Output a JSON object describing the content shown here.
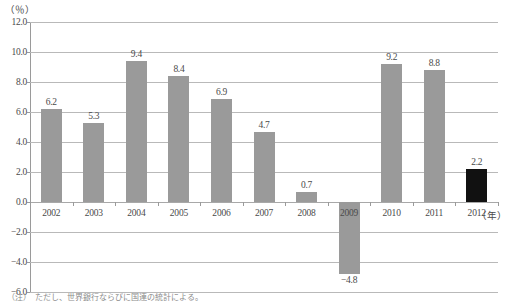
{
  "chart_data": {
    "type": "bar",
    "title": "",
    "subtitle": "",
    "xlabel": "(年)",
    "ylabel": "(%)",
    "categories": [
      "2002",
      "2003",
      "2004",
      "2005",
      "2006",
      "2007",
      "2008",
      "2009",
      "2010",
      "2011",
      "2012"
    ],
    "values": [
      6.2,
      5.3,
      9.4,
      8.4,
      6.9,
      4.7,
      0.7,
      -4.8,
      9.2,
      8.8,
      2.2
    ],
    "value_labels": [
      "6.2",
      "5.3",
      "9.4",
      "8.4",
      "6.9",
      "4.7",
      "0.7",
      "−4.8",
      "9.2",
      "8.8",
      "2.2"
    ],
    "highlight_index": 10,
    "ylim": [
      -6.0,
      12.0
    ],
    "yticks": [
      12.0,
      10.0,
      8.0,
      6.0,
      4.0,
      2.0,
      0.0,
      -2.0,
      -4.0,
      -6.0
    ],
    "ytick_labels": [
      "12.0",
      "10.0",
      "8.0",
      "6.0",
      "4.0",
      "2.0",
      "0.0",
      "−2.0",
      "−4.0",
      "−6.0"
    ],
    "grid": true,
    "legend": "none",
    "series": [
      {
        "name": "",
        "values": [
          6.2,
          5.3,
          9.4,
          8.4,
          6.9,
          4.7,
          0.7,
          -4.8,
          9.2,
          8.8,
          2.2
        ]
      }
    ]
  },
  "axis": {
    "unit_label": "（％）",
    "x_unit_label": "（年）"
  },
  "colors": {
    "bar_default": "#9a9a9a",
    "bar_highlight": "#111111",
    "gridline": "#b9b9b9",
    "axis": "#9a9a9a",
    "text": "#4a4a4a",
    "background": "#ffffff"
  },
  "footnote": {
    "text": "（注）　ただし、世界銀行ならびに国連の統計による。"
  }
}
